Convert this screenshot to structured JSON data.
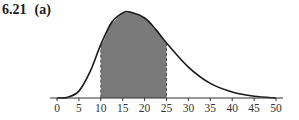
{
  "header": {
    "problem_number": "6.21",
    "part": "(a)"
  },
  "colors": {
    "curve": "#1a1a1a",
    "shade": "#7a7a7a",
    "axis": "#333333",
    "bounds": "#555555"
  },
  "chart_data": {
    "type": "area",
    "xlabel": "",
    "ylabel": "",
    "xlim": [
      0,
      50
    ],
    "x_ticks": [
      0,
      5,
      10,
      15,
      20,
      25,
      30,
      35,
      40,
      45,
      50
    ],
    "shaded_interval": [
      10,
      25
    ],
    "peak_x": 16.7,
    "grid": false,
    "legend": null,
    "curve_points": [
      {
        "x": 0,
        "y": 0.0
      },
      {
        "x": 2.5,
        "y": 0.01
      },
      {
        "x": 5,
        "y": 0.08
      },
      {
        "x": 7.5,
        "y": 0.3
      },
      {
        "x": 10,
        "y": 0.62
      },
      {
        "x": 12.5,
        "y": 0.88
      },
      {
        "x": 15,
        "y": 0.99
      },
      {
        "x": 16.7,
        "y": 1.0
      },
      {
        "x": 20,
        "y": 0.93
      },
      {
        "x": 22.5,
        "y": 0.8
      },
      {
        "x": 25,
        "y": 0.64
      },
      {
        "x": 30,
        "y": 0.36
      },
      {
        "x": 35,
        "y": 0.17
      },
      {
        "x": 40,
        "y": 0.07
      },
      {
        "x": 45,
        "y": 0.02
      },
      {
        "x": 50,
        "y": 0.0
      }
    ]
  }
}
